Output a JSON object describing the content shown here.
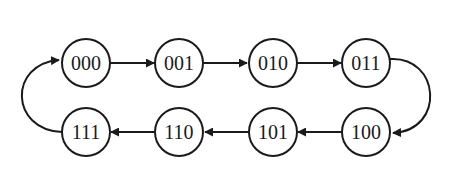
{
  "diagram": {
    "type": "state-transition-cycle",
    "nodes": [
      {
        "id": "s000",
        "label": "000"
      },
      {
        "id": "s001",
        "label": "001"
      },
      {
        "id": "s010",
        "label": "010"
      },
      {
        "id": "s011",
        "label": "011"
      },
      {
        "id": "s100",
        "label": "100"
      },
      {
        "id": "s101",
        "label": "101"
      },
      {
        "id": "s110",
        "label": "110"
      },
      {
        "id": "s111",
        "label": "111"
      }
    ],
    "edges": [
      {
        "from": "000",
        "to": "001"
      },
      {
        "from": "001",
        "to": "010"
      },
      {
        "from": "010",
        "to": "011"
      },
      {
        "from": "011",
        "to": "100"
      },
      {
        "from": "100",
        "to": "101"
      },
      {
        "from": "101",
        "to": "110"
      },
      {
        "from": "110",
        "to": "111"
      },
      {
        "from": "111",
        "to": "000"
      }
    ],
    "colors": {
      "stroke": "#1a1a1a",
      "background": "#ffffff"
    }
  }
}
